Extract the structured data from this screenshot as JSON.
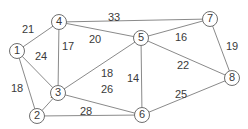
{
  "graph": {
    "type": "weighted-undirected",
    "nodes": [
      {
        "id": "1",
        "label": "1",
        "x": 17,
        "y": 51
      },
      {
        "id": "2",
        "label": "2",
        "x": 37,
        "y": 116
      },
      {
        "id": "3",
        "label": "3",
        "x": 58,
        "y": 93
      },
      {
        "id": "4",
        "label": "4",
        "x": 59,
        "y": 22
      },
      {
        "id": "5",
        "label": "5",
        "x": 141,
        "y": 38
      },
      {
        "id": "6",
        "label": "6",
        "x": 142,
        "y": 115
      },
      {
        "id": "7",
        "label": "7",
        "x": 210,
        "y": 19
      },
      {
        "id": "8",
        "label": "8",
        "x": 232,
        "y": 78
      }
    ],
    "edges": [
      {
        "from": "1",
        "to": "4",
        "weight": "21",
        "lx": 28,
        "ly": 30
      },
      {
        "from": "1",
        "to": "3",
        "weight": "24",
        "lx": 41,
        "ly": 57
      },
      {
        "from": "1",
        "to": "2",
        "weight": "18",
        "lx": 17,
        "ly": 89
      },
      {
        "from": "4",
        "to": "3",
        "weight": "17",
        "lx": 68,
        "ly": 47
      },
      {
        "from": "4",
        "to": "7",
        "weight": "33",
        "lx": 114,
        "ly": 18
      },
      {
        "from": "4",
        "to": "5",
        "weight": "20",
        "lx": 95,
        "ly": 40
      },
      {
        "from": "3",
        "to": "5",
        "weight": "18",
        "lx": 107,
        "ly": 74
      },
      {
        "from": "3",
        "to": "2",
        "weight": "12",
        "lx": 56,
        "ly": 95
      },
      {
        "from": "3",
        "to": "6",
        "weight": "26",
        "lx": 107,
        "ly": 90
      },
      {
        "from": "5",
        "to": "7",
        "weight": "16",
        "lx": 181,
        "ly": 38
      },
      {
        "from": "5",
        "to": "6",
        "weight": "14",
        "lx": 133,
        "ly": 79
      },
      {
        "from": "5",
        "to": "8",
        "weight": "22",
        "lx": 183,
        "ly": 66
      },
      {
        "from": "7",
        "to": "8",
        "weight": "19",
        "lx": 232,
        "ly": 47
      },
      {
        "from": "2",
        "to": "6",
        "weight": "28",
        "lx": 86,
        "ly": 112
      },
      {
        "from": "6",
        "to": "8",
        "weight": "25",
        "lx": 181,
        "ly": 95
      }
    ]
  },
  "colors": {
    "edge": "#8a8a8a",
    "node_stroke": "#6f6f6f",
    "text": "#3a3a3a",
    "background": "#ffffff"
  }
}
